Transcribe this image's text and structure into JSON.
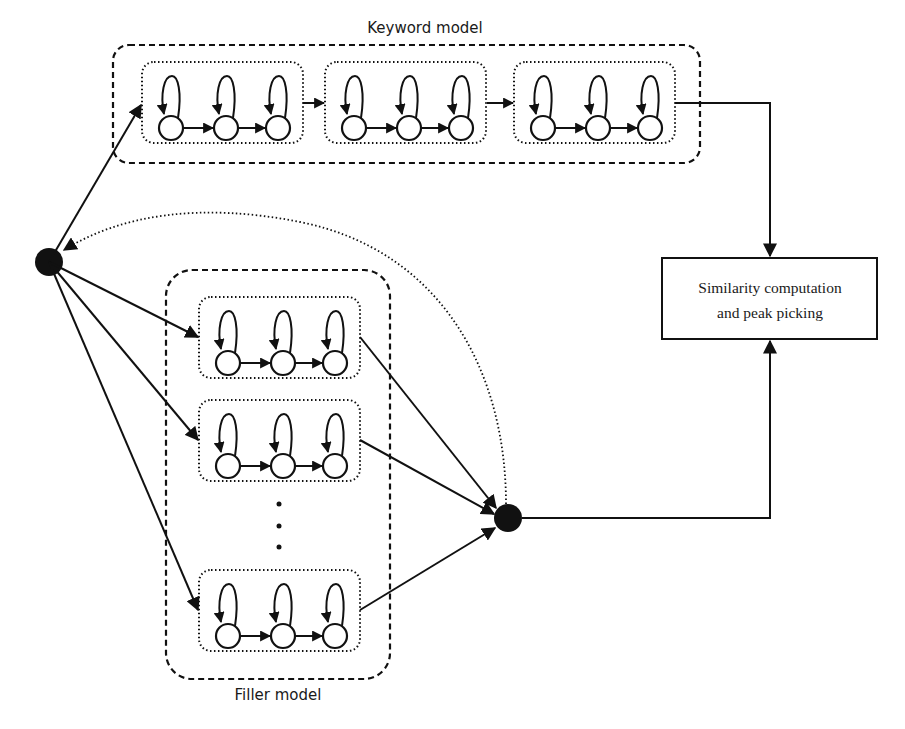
{
  "header_fragment": "... taken into consideration.",
  "keyword_model": {
    "label": "Keyword model",
    "sub_models": 3,
    "states_per_sub_model": 3
  },
  "filler_model": {
    "label": "Filler model",
    "visible_sub_models": 3,
    "ellipsis": "⋮",
    "states_per_sub_model": 3
  },
  "similarity_box": {
    "line1": "Similarity computation",
    "line2": "and peak picking"
  },
  "nodes": {
    "start": "start-node",
    "end": "end-node"
  },
  "colors": {
    "stroke": "#111111",
    "background": "#ffffff"
  }
}
